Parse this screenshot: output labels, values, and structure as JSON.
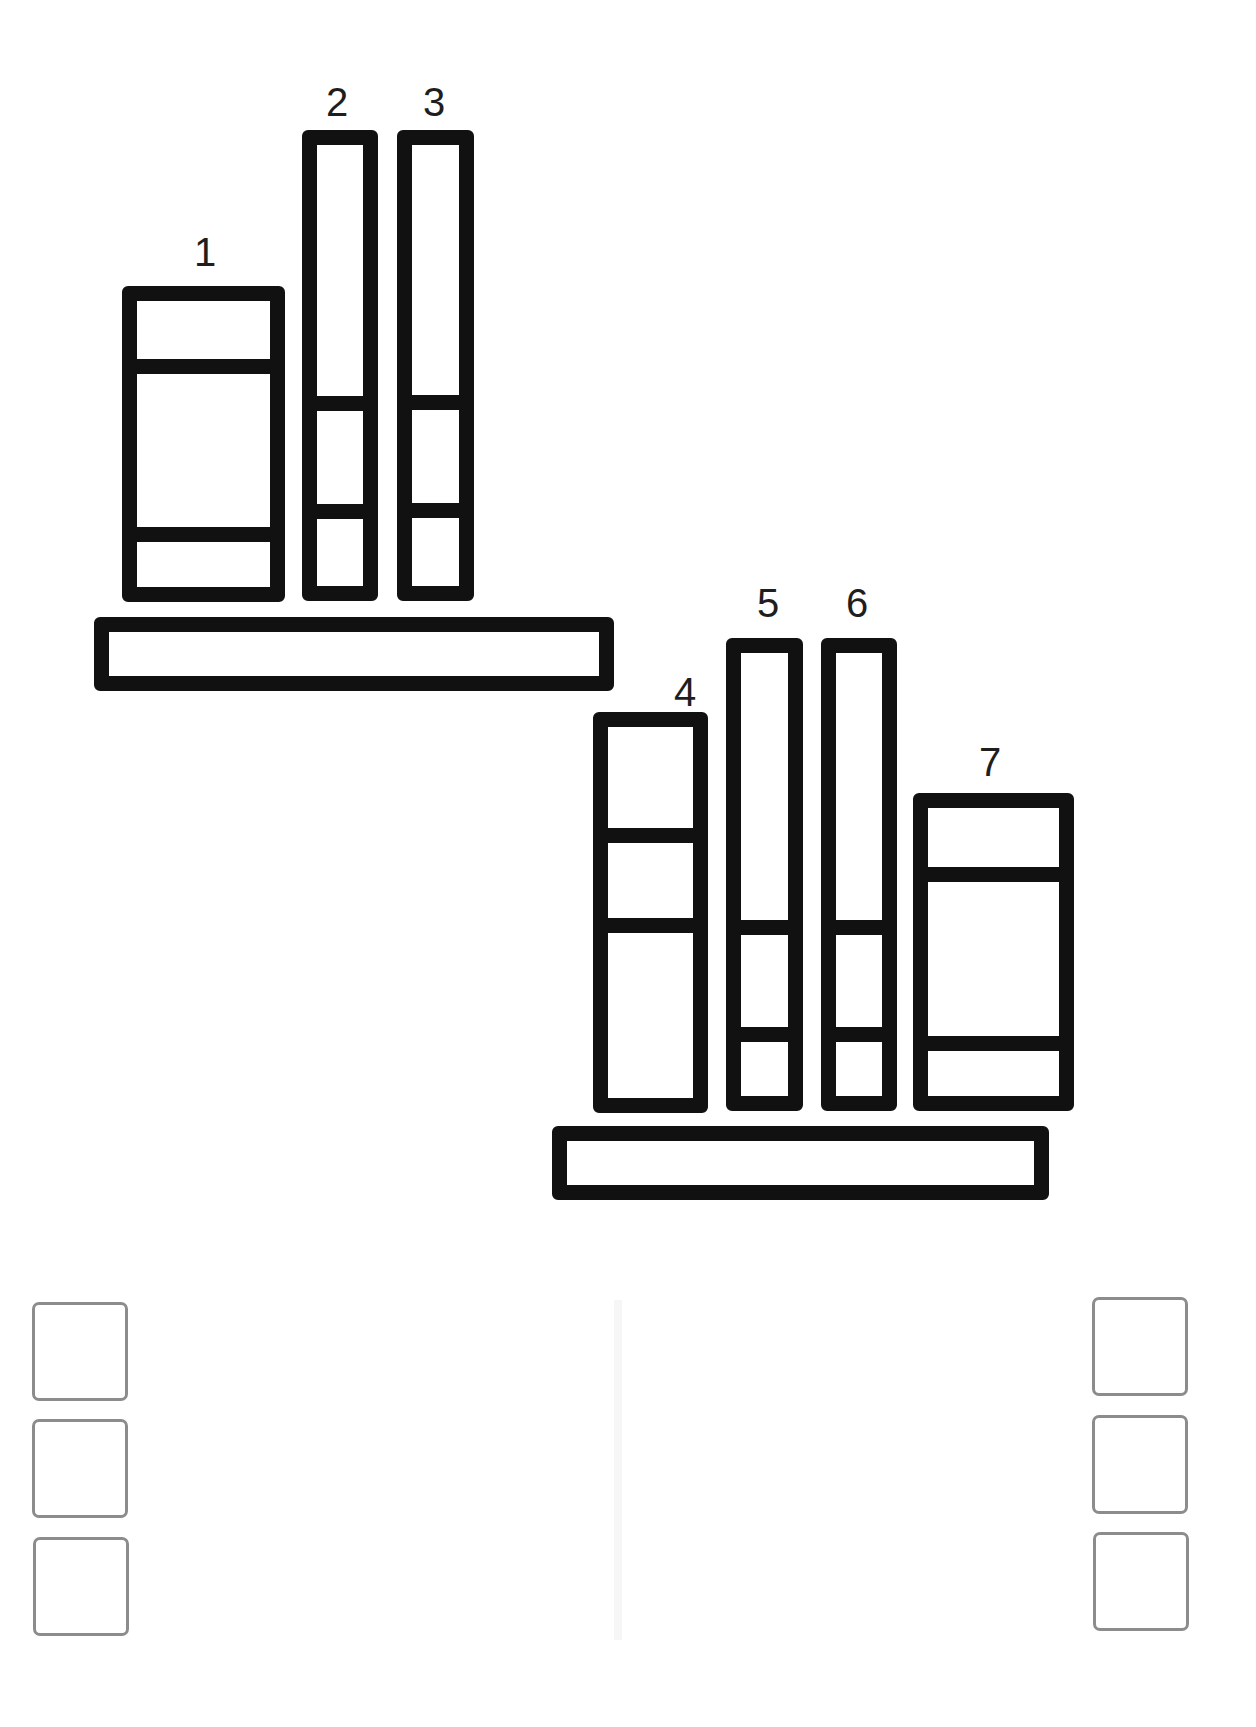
{
  "diagram": {
    "type": "bookshelf-puzzle",
    "stroke_color": "#111111",
    "label_color": "#1e1e1e",
    "answer_box_border_color": "#8c8c8c",
    "shelves": [
      {
        "id": "top-shelf",
        "books": [
          {
            "label": "1",
            "dividers": 2
          },
          {
            "label": "2",
            "dividers": 2
          },
          {
            "label": "3",
            "dividers": 2
          }
        ]
      },
      {
        "id": "bottom-shelf",
        "books": [
          {
            "label": "4",
            "dividers": 2
          },
          {
            "label": "5",
            "dividers": 2
          },
          {
            "label": "6",
            "dividers": 2
          },
          {
            "label": "7",
            "dividers": 2
          }
        ]
      }
    ],
    "answer_boxes": {
      "left_column": [
        "",
        "",
        ""
      ],
      "right_column": [
        "",
        "",
        ""
      ]
    }
  }
}
